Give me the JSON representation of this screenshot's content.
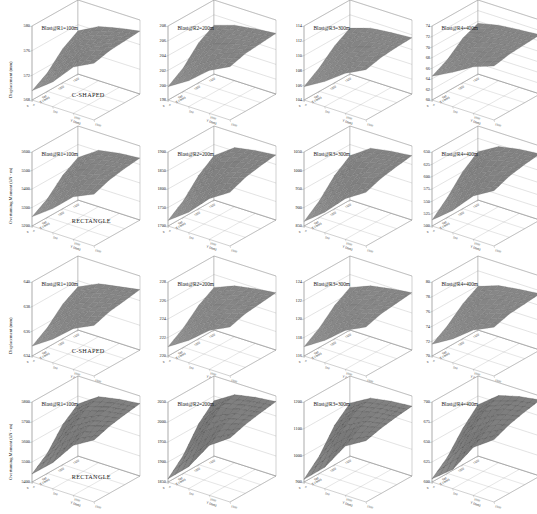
{
  "figure": {
    "width": 537,
    "height": 514,
    "background": "#ffffff",
    "rows": 4,
    "cols": 4,
    "line_color": "#8c8c8c",
    "surface_fill": "#8a8a8a",
    "surface_fill_dark": "#4a4a4a",
    "surface_stroke": "#5a5a5a"
  },
  "axis_names": {
    "x": "X (mm)",
    "y": "Y (mm)",
    "z_displacement": "Displacement (mm)",
    "z_moment": "Overturning Moment (kN - m)"
  },
  "x_tick_labels": [
    "0",
    "500",
    "1000",
    "1500"
  ],
  "y_tick_labels": [
    "0",
    "500",
    "1000",
    "1500"
  ],
  "chart_data": [
    {
      "id": "r1c1",
      "type": "surface",
      "title": "Blast@R1=100m",
      "shape_label": "C-SHAPED",
      "zlabel": "Displacement (mm)",
      "xlabel": "X (mm)",
      "ylabel": "Y (mm)",
      "zticks": [
        "580",
        "576",
        "572",
        "568"
      ],
      "zlim": [
        568,
        580
      ],
      "x": [
        0,
        500,
        1000,
        1500
      ],
      "y": [
        0,
        500,
        1000,
        1500
      ],
      "z": [
        [
          569.5,
          572.0,
          575.5,
          577.2
        ],
        [
          571.0,
          574.5,
          576.8,
          577.8
        ],
        [
          573.5,
          576.0,
          577.3,
          578.0
        ],
        [
          575.0,
          576.8,
          577.6,
          578.2
        ]
      ]
    },
    {
      "id": "r1c2",
      "type": "surface",
      "title": "Blast@R2=200m",
      "shape_label": "",
      "zlabel": "",
      "xlabel": "X (mm)",
      "ylabel": "Y (mm)",
      "zticks": [
        "208",
        "206",
        "204",
        "202",
        "200",
        "198"
      ],
      "zlim": [
        198,
        208
      ],
      "x": [
        0,
        500,
        1000,
        1500
      ],
      "y": [
        0,
        500,
        1000,
        1500
      ],
      "z": [
        [
          199.8,
          201.5,
          203.8,
          205.2
        ],
        [
          201.2,
          203.6,
          205.0,
          205.8
        ],
        [
          203.4,
          205.0,
          205.6,
          206.0
        ],
        [
          204.6,
          205.5,
          205.9,
          206.2
        ]
      ]
    },
    {
      "id": "r1c3",
      "type": "surface",
      "title": "Blast@R3=300m",
      "shape_label": "",
      "zlabel": "",
      "xlabel": "X (mm)",
      "ylabel": "Y (mm)",
      "zticks": [
        "114",
        "112",
        "110",
        "108",
        "106",
        "104"
      ],
      "zlim": [
        104,
        114
      ],
      "x": [
        0,
        500,
        1000,
        1500
      ],
      "y": [
        0,
        500,
        1000,
        1500
      ],
      "z": [
        [
          105.8,
          107.4,
          109.4,
          110.8
        ],
        [
          107.2,
          109.2,
          110.6,
          111.3
        ],
        [
          109.0,
          110.6,
          111.2,
          111.5
        ],
        [
          110.2,
          111.1,
          111.4,
          111.6
        ]
      ]
    },
    {
      "id": "r1c4",
      "type": "surface",
      "title": "Blast@R4=400m",
      "shape_label": "",
      "zlabel": "",
      "xlabel": "X (mm)",
      "ylabel": "Y (mm)",
      "zticks": [
        "74",
        "72",
        "70",
        "68",
        "66",
        "64",
        "62",
        "60"
      ],
      "zlim": [
        60,
        74
      ],
      "x": [
        0,
        500,
        1000,
        1500
      ],
      "y": [
        0,
        500,
        1000,
        1500
      ],
      "z": [
        [
          64.5,
          66.5,
          68.8,
          70.2
        ],
        [
          66.0,
          68.6,
          70.0,
          70.8
        ],
        [
          68.4,
          70.0,
          70.6,
          71.0
        ],
        [
          69.6,
          70.5,
          70.9,
          71.2
        ]
      ]
    },
    {
      "id": "r2c1",
      "type": "surface",
      "title": "Blast@R1=100m",
      "shape_label": "RECTANGLE",
      "zlabel": "Overturning Moment (kN - m)",
      "xlabel": "X (mm)",
      "ylabel": "Y (mm)",
      "zticks": [
        "5600",
        "5500",
        "5400",
        "5300",
        "5200"
      ],
      "zlim": [
        5200,
        5600
      ],
      "x": [
        0,
        500,
        1000,
        1500
      ],
      "y": [
        0,
        500,
        1000,
        1500
      ],
      "z": [
        [
          5250,
          5330,
          5430,
          5480
        ],
        [
          5300,
          5420,
          5480,
          5510
        ],
        [
          5380,
          5480,
          5510,
          5525
        ],
        [
          5430,
          5505,
          5525,
          5535
        ]
      ]
    },
    {
      "id": "r2c2",
      "type": "surface",
      "title": "Blast@R2=200m",
      "shape_label": "",
      "zlabel": "",
      "xlabel": "X (mm)",
      "ylabel": "Y (mm)",
      "zticks": [
        "1900",
        "1850",
        "1800",
        "1750",
        "1700"
      ],
      "zlim": [
        1700,
        1900
      ],
      "x": [
        0,
        500,
        1000,
        1500
      ],
      "y": [
        0,
        500,
        1000,
        1500
      ],
      "z": [
        [
          1715,
          1755,
          1810,
          1845
        ],
        [
          1745,
          1805,
          1845,
          1862
        ],
        [
          1790,
          1845,
          1862,
          1870
        ],
        [
          1820,
          1860,
          1870,
          1876
        ]
      ]
    },
    {
      "id": "r2c3",
      "type": "surface",
      "title": "Blast@R3=300m",
      "shape_label": "",
      "zlabel": "",
      "xlabel": "X (mm)",
      "ylabel": "Y (mm)",
      "zticks": [
        "1050",
        "1000",
        "950",
        "900",
        "850"
      ],
      "zlim": [
        850,
        1050
      ],
      "x": [
        0,
        500,
        1000,
        1500
      ],
      "y": [
        0,
        500,
        1000,
        1500
      ],
      "z": [
        [
          862,
          905,
          960,
          995
        ],
        [
          895,
          955,
          995,
          1010
        ],
        [
          940,
          995,
          1010,
          1018
        ],
        [
          970,
          1008,
          1018,
          1024
        ]
      ]
    },
    {
      "id": "r2c4",
      "type": "surface",
      "title": "Blast@R4=400m",
      "shape_label": "",
      "zlabel": "",
      "xlabel": "X (mm)",
      "ylabel": "Y (mm)",
      "zticks": [
        "650",
        "625",
        "600",
        "575",
        "550",
        "525",
        "500"
      ],
      "zlim": [
        500,
        650
      ],
      "x": [
        0,
        500,
        1000,
        1500
      ],
      "y": [
        0,
        500,
        1000,
        1500
      ],
      "z": [
        [
          512,
          545,
          588,
          612
        ],
        [
          540,
          585,
          612,
          624
        ],
        [
          575,
          612,
          624,
          630
        ],
        [
          598,
          622,
          630,
          634
        ]
      ]
    },
    {
      "id": "r3c1",
      "type": "surface",
      "title": "Blast@R1=100m",
      "shape_label": "C-SHAPED",
      "zlabel": "Displacement (mm)",
      "xlabel": "X (mm)",
      "ylabel": "Y (mm)",
      "zticks": [
        "640",
        "638",
        "636",
        "634"
      ],
      "zlim": [
        634,
        640
      ],
      "x": [
        0,
        500,
        1000,
        1500
      ],
      "y": [
        0,
        500,
        1000,
        1500
      ],
      "z": [
        [
          634.8,
          635.9,
          637.3,
          638.1
        ],
        [
          635.6,
          637.1,
          638.0,
          638.5
        ],
        [
          636.8,
          637.9,
          638.4,
          638.7
        ],
        [
          637.5,
          638.3,
          638.6,
          638.9
        ]
      ]
    },
    {
      "id": "r3c2",
      "type": "surface",
      "title": "Blast@R2=200m",
      "shape_label": "",
      "zlabel": "",
      "xlabel": "X (mm)",
      "ylabel": "Y (mm)",
      "zticks": [
        "228",
        "226",
        "224",
        "222",
        "220"
      ],
      "zlim": [
        220,
        228
      ],
      "x": [
        0,
        500,
        1000,
        1500
      ],
      "y": [
        0,
        500,
        1000,
        1500
      ],
      "z": [
        [
          221.0,
          222.4,
          224.2,
          225.3
        ],
        [
          222.1,
          224.0,
          225.1,
          225.8
        ],
        [
          223.6,
          225.0,
          225.6,
          226.0
        ],
        [
          224.6,
          225.5,
          225.9,
          226.2
        ]
      ]
    },
    {
      "id": "r3c3",
      "type": "surface",
      "title": "Blast@R3=300m",
      "shape_label": "",
      "zlabel": "",
      "xlabel": "X (mm)",
      "ylabel": "Y (mm)",
      "zticks": [
        "124",
        "122",
        "120",
        "118",
        "116"
      ],
      "zlim": [
        116,
        124
      ],
      "x": [
        0,
        500,
        1000,
        1500
      ],
      "y": [
        0,
        500,
        1000,
        1500
      ],
      "z": [
        [
          117.0,
          118.4,
          120.2,
          121.3
        ],
        [
          118.1,
          120.0,
          121.1,
          121.8
        ],
        [
          119.6,
          121.0,
          121.6,
          122.0
        ],
        [
          120.6,
          121.5,
          121.9,
          122.2
        ]
      ]
    },
    {
      "id": "r3c4",
      "type": "surface",
      "title": "Blast@R4=400m",
      "shape_label": "",
      "zlabel": "",
      "xlabel": "X (mm)",
      "ylabel": "Y (mm)",
      "zticks": [
        "80",
        "78",
        "76",
        "74",
        "72",
        "70"
      ],
      "zlim": [
        70,
        80
      ],
      "x": [
        0,
        500,
        1000,
        1500
      ],
      "y": [
        0,
        500,
        1000,
        1500
      ],
      "z": [
        [
          71.6,
          73.2,
          75.3,
          76.6
        ],
        [
          72.9,
          75.0,
          76.4,
          77.2
        ],
        [
          74.7,
          76.3,
          77.0,
          77.4
        ],
        [
          75.9,
          76.9,
          77.3,
          77.6
        ]
      ]
    },
    {
      "id": "r4c1",
      "type": "surface",
      "title": "Blast@R1=100m",
      "shape_label": "RECTANGLE",
      "zlabel": "Overturning Moment (kN - m)",
      "xlabel": "X (mm)",
      "ylabel": "Y (mm)",
      "zticks": [
        "5800",
        "5700",
        "5600",
        "5500",
        "5400"
      ],
      "zlim": [
        5400,
        5800
      ],
      "x": [
        0,
        500,
        1000,
        1500
      ],
      "y": [
        0,
        500,
        1000,
        1500
      ],
      "z": [
        [
          5440,
          5530,
          5650,
          5710
        ],
        [
          5500,
          5630,
          5705,
          5735
        ],
        [
          5600,
          5700,
          5735,
          5750
        ],
        [
          5660,
          5730,
          5750,
          5762
        ]
      ]
    },
    {
      "id": "r4c2",
      "type": "surface",
      "title": "Blast@R2=200m",
      "shape_label": "",
      "zlabel": "",
      "xlabel": "X (mm)",
      "ylabel": "Y (mm)",
      "zticks": [
        "2050",
        "2000",
        "1950",
        "1900",
        "1850"
      ],
      "zlim": [
        1850,
        2050
      ],
      "x": [
        0,
        500,
        1000,
        1500
      ],
      "y": [
        0,
        500,
        1000,
        1500
      ],
      "z": [
        [
          1858,
          1905,
          1975,
          2010
        ],
        [
          1895,
          1970,
          2008,
          2022
        ],
        [
          1952,
          2008,
          2022,
          2030
        ],
        [
          1988,
          2020,
          2030,
          2036
        ]
      ]
    },
    {
      "id": "r4c3",
      "type": "surface",
      "title": "Blast@R3=300m",
      "shape_label": "",
      "zlabel": "",
      "xlabel": "X (mm)",
      "ylabel": "Y (mm)",
      "zticks": [
        "1200",
        "1100",
        "1000",
        "900"
      ],
      "zlim": [
        900,
        1200
      ],
      "x": [
        0,
        500,
        1000,
        1500
      ],
      "y": [
        0,
        500,
        1000,
        1500
      ],
      "z": [
        [
          910,
          980,
          1085,
          1130
        ],
        [
          965,
          1075,
          1128,
          1145
        ],
        [
          1048,
          1126,
          1145,
          1155
        ],
        [
          1098,
          1142,
          1155,
          1162
        ]
      ]
    },
    {
      "id": "r4c4",
      "type": "surface",
      "title": "Blast@R4=400m",
      "shape_label": "",
      "zlabel": "",
      "xlabel": "X (mm)",
      "ylabel": "Y (mm)",
      "zticks": [
        "700",
        "675",
        "650",
        "625",
        "600"
      ],
      "zlim": [
        600,
        700
      ],
      "x": [
        0,
        500,
        1000,
        1500
      ],
      "y": [
        0,
        500,
        1000,
        1500
      ],
      "z": [
        [
          604,
          624,
          660,
          678
        ],
        [
          620,
          655,
          676,
          686
        ],
        [
          645,
          675,
          686,
          691
        ],
        [
          664,
          684,
          691,
          695
        ]
      ]
    }
  ]
}
